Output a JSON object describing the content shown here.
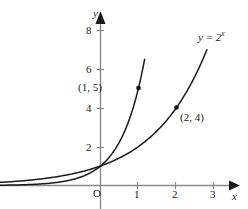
{
  "figure": {
    "axes": {
      "x_label": "x",
      "y_label": "y",
      "origin_label": "O",
      "x_ticks": [
        "1",
        "2",
        "3"
      ],
      "y_ticks": [
        "8",
        "6",
        "4",
        "2"
      ]
    },
    "annotations": {
      "point1_label": "(1, 5)",
      "point2_label": "(2, 4)",
      "curve_label_base": "y = 2",
      "curve_label_exponent": "x"
    },
    "colors": {
      "curve": "#1a1a1a",
      "axis": "#7f7f7f",
      "text": "#1a1a1a",
      "background": "#ffffff"
    }
  },
  "chart_data": {
    "type": "line",
    "title": "",
    "xlabel": "x",
    "ylabel": "y",
    "xlim": [
      -2.65,
      3.5
    ],
    "ylim": [
      -0.1,
      8.75
    ],
    "xticks": [
      1,
      2,
      3
    ],
    "yticks": [
      2,
      4,
      6,
      8
    ],
    "grid": false,
    "legend": "none",
    "series": [
      {
        "name": "y = 5^x",
        "expression": "5^x",
        "x": [
          -2.65,
          -2.4,
          -2.0,
          -1.6,
          -1.2,
          -0.8,
          -0.4,
          0.0,
          0.3,
          0.6,
          0.9,
          1.0,
          1.1,
          1.15
        ],
        "y": [
          0.032,
          0.047,
          0.04,
          0.076,
          0.145,
          0.276,
          0.525,
          1.0,
          1.62,
          2.63,
          4.26,
          5.0,
          5.87,
          6.36
        ]
      },
      {
        "name": "y = 2^x",
        "expression": "2^x",
        "x": [
          -2.65,
          -2.4,
          -2.0,
          -1.6,
          -1.2,
          -0.8,
          -0.4,
          0.0,
          0.5,
          1.0,
          1.5,
          2.0,
          2.4,
          2.7,
          2.8
        ],
        "y": [
          0.159,
          0.189,
          0.25,
          0.33,
          0.435,
          0.574,
          0.758,
          1.0,
          1.41,
          2.0,
          2.83,
          4.0,
          5.28,
          6.5,
          7.0
        ]
      }
    ],
    "annotated_points": [
      {
        "label": "(1, 5)",
        "x": 1,
        "y": 5,
        "series": "y = 5^x"
      },
      {
        "label": "(2, 4)",
        "x": 2,
        "y": 4,
        "series": "y = 2^x"
      }
    ]
  }
}
